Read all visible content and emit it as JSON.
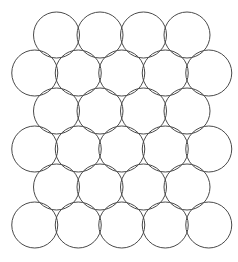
{
  "figure": {
    "name": "hexagonal-circle-packing",
    "title": "",
    "width": 238,
    "height": 262,
    "background_color": "#ffffff"
  },
  "style": {
    "stroke_color": "#4a4a4a",
    "stroke_width": 1,
    "fill_color": "none"
  },
  "chart_data": {
    "type": "diagram",
    "subtype": "circle-packing",
    "title": "",
    "xlabel": "",
    "ylabel": "",
    "grid": false,
    "legend": null,
    "lattice": "hexagonal-close-packing",
    "circle_count": 27,
    "row_count": 6,
    "radius": 23,
    "diameter": 46,
    "horizontal_spacing": 43.5,
    "vertical_spacing": 38,
    "row_offsets": [
      21.75,
      0,
      21.75,
      0,
      21.75,
      0
    ],
    "counts_per_row": [
      4,
      5,
      4,
      5,
      4,
      5
    ],
    "row_centers_y": [
      35,
      73,
      111,
      149,
      187,
      225
    ],
    "rows": [
      {
        "index": 0,
        "count": 4,
        "cy": 35,
        "cx": [
          56.5,
          100,
          143.5,
          187
        ]
      },
      {
        "index": 1,
        "count": 5,
        "cy": 73,
        "cx": [
          34.75,
          78.25,
          121.75,
          165.25,
          208.75
        ]
      },
      {
        "index": 2,
        "count": 4,
        "cy": 111,
        "cx": [
          56.5,
          100,
          143.5,
          187
        ]
      },
      {
        "index": 3,
        "count": 5,
        "cy": 149,
        "cx": [
          34.75,
          78.25,
          121.75,
          165.25,
          208.75
        ]
      },
      {
        "index": 4,
        "count": 4,
        "cy": 187,
        "cx": [
          56.5,
          100,
          143.5,
          187
        ]
      },
      {
        "index": 5,
        "count": 5,
        "cy": 225,
        "cx": [
          34.75,
          78.25,
          121.75,
          165.25,
          208.75
        ]
      }
    ]
  }
}
